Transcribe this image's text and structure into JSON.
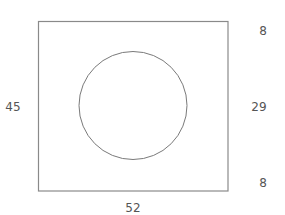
{
  "diagram": {
    "rectangle": {
      "x": 38.5,
      "y": 21.5,
      "width": 189.5,
      "height": 169.5,
      "stroke": "#8a8a8a"
    },
    "circle": {
      "cx": 133,
      "cy": 105.5,
      "r": 54,
      "stroke": "#7a7a7a"
    },
    "labels": {
      "left_height": "45",
      "bottom_width": "52",
      "right_top": "8",
      "right_middle": "29",
      "right_bottom": "8"
    },
    "text_color": "#555555"
  }
}
